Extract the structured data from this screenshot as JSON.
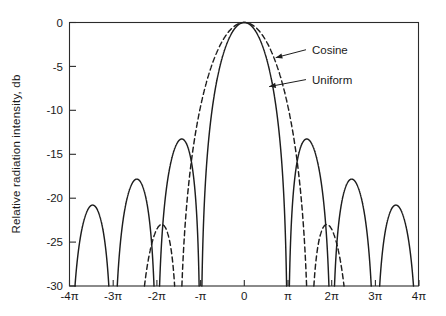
{
  "chart_data": {
    "type": "line",
    "title": "",
    "subtitle": "",
    "xlabel": "",
    "ylabel": "Relative radiation intensity, db",
    "xlim": [
      -12.566370614,
      12.566370614
    ],
    "ylim": [
      -30,
      0
    ],
    "grid": false,
    "legend_position": "inline-annotations",
    "x_unit": "radians (multiples of pi)",
    "y_unit": "db",
    "xticks": [
      -12.566370614,
      -9.424777961,
      -6.283185307,
      -3.141592654,
      0,
      3.141592654,
      6.283185307,
      9.424777961,
      12.566370614
    ],
    "xticklabels": [
      "-4π",
      "-3π",
      "-2π",
      "-π",
      "0",
      "π",
      "2π",
      "3π",
      "4π"
    ],
    "yticks": [
      0,
      -5,
      -10,
      -15,
      -20,
      -25,
      -30
    ],
    "yticklabels": [
      "0",
      "-5",
      "-10",
      "-15",
      "-20",
      "-25",
      "-30"
    ],
    "series": [
      {
        "name": "Uniform",
        "style": "solid",
        "color": "#1d1d1d",
        "formula": "20*log10(|sin(u)/u|)",
        "peak_db": 0,
        "peak_x": 0,
        "nulls_x_pi": [
          -4,
          -3,
          -2,
          -1,
          1,
          2,
          3,
          4
        ],
        "sidelobe_peaks_db": [
          -21.0,
          -18.0,
          -13.3,
          -13.3,
          -18.0,
          -21.0
        ],
        "sidelobe_peaks_x_pi": [
          -3.47,
          -2.46,
          -1.43,
          1.43,
          2.46,
          3.47
        ],
        "first_null_x_pi": 1.0,
        "half_power_beamwidth_x_pi": 0.443
      },
      {
        "name": "Cosine",
        "style": "dashed",
        "color": "#1d1d1d",
        "formula": "20*log10(|(pi/2)^2 * cos(u)/((pi/2)^2 - u^2)|)",
        "peak_db": 0,
        "peak_x": 0,
        "nulls_x_pi": [
          -3.5,
          -2.5,
          -1.5,
          1.5,
          2.5,
          3.5
        ],
        "sidelobe_peaks_db": [
          -31.5,
          -23.5,
          -23.5,
          -31.5
        ],
        "sidelobe_peaks_x_pi": [
          -3.0,
          -2.0,
          2.0,
          3.0
        ],
        "first_null_x_pi": 1.5,
        "half_power_beamwidth_x_pi": 0.594
      }
    ],
    "annotations": [
      {
        "text": "Cosine",
        "target_series": "Cosine",
        "target_x_pi": 0.72,
        "target_y_db": -4.0,
        "label_x_pi": 1.55,
        "label_y_db": -3.1
      },
      {
        "text": "Uniform",
        "target_series": "Uniform",
        "target_x_pi": 0.57,
        "target_y_db": -7.3,
        "label_x_pi": 1.55,
        "label_y_db": -6.5
      }
    ]
  },
  "axis": {
    "y_title": "Relative radiation intensity, db",
    "x_title": ""
  },
  "labels": {
    "cosine": "Cosine",
    "uniform": "Uniform"
  }
}
